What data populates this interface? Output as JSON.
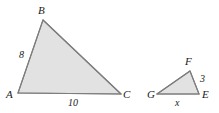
{
  "figure": {
    "kind": "similar-triangles-diagram",
    "width": 219,
    "height": 113,
    "background_color": "#ffffff",
    "fill_color": "#e2e2e2",
    "stroke_color": "#7d7d7d",
    "label_color": "#1a1a1a",
    "triangles": [
      {
        "name": "triangle-abc",
        "vertices": [
          {
            "label": "A",
            "x": 18,
            "y": 93
          },
          {
            "label": "B",
            "x": 43,
            "y": 20
          },
          {
            "label": "C",
            "x": 121,
            "y": 94
          }
        ],
        "side_labels": [
          {
            "label": "8",
            "side": "AB"
          },
          {
            "label": "10",
            "side": "AC"
          }
        ]
      },
      {
        "name": "triangle-gef",
        "vertices": [
          {
            "label": "G",
            "x": 157,
            "y": 94
          },
          {
            "label": "F",
            "x": 190,
            "y": 71
          },
          {
            "label": "E",
            "x": 199,
            "y": 94
          }
        ],
        "side_labels": [
          {
            "label": "3",
            "side": "FE"
          },
          {
            "label": "x",
            "side": "GE"
          }
        ]
      }
    ],
    "vertex_labels": {
      "a": "A",
      "b": "B",
      "c": "C",
      "f": "F",
      "g": "G",
      "e": "E"
    },
    "measure_labels": {
      "ab": "8",
      "ac": "10",
      "fe": "3",
      "ge": "x"
    }
  }
}
